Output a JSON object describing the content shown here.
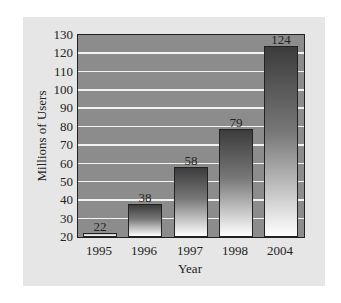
{
  "chart_data": {
    "type": "bar",
    "title": "",
    "categories": [
      "1995",
      "1996",
      "1997",
      "1998",
      "2004"
    ],
    "values": [
      22,
      38,
      58,
      79,
      124
    ],
    "data_labels": [
      "22",
      "38",
      "58",
      "79",
      "124"
    ],
    "xlabel": "Year",
    "ylabel": "Millions of Users",
    "ylim": [
      20,
      130
    ],
    "yticks": [
      "20",
      "30",
      "40",
      "50",
      "60",
      "70",
      "80",
      "90",
      "100",
      "110",
      "120",
      "130"
    ],
    "grid": true,
    "legend": null
  },
  "colors": {
    "panel_bg": "#e6e6e6",
    "plot_bg": "#8c8c8c",
    "gridline": "#f2f2f2",
    "bar_top": "#3c3c3c",
    "bar_bottom": "#ffffff"
  }
}
